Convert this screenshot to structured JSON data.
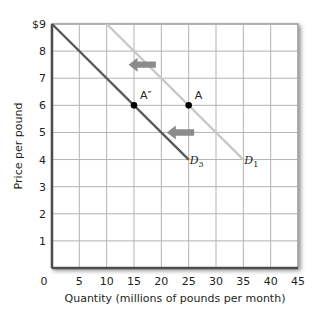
{
  "chart_data": {
    "type": "line",
    "title": "",
    "xlabel": "Quantity (millions of pounds per month)",
    "ylabel": "Price per pound",
    "xlim": [
      0,
      45
    ],
    "ylim": [
      0,
      9
    ],
    "grid": true,
    "x_ticks": [
      0,
      5,
      10,
      15,
      20,
      25,
      30,
      35,
      40,
      45
    ],
    "y_ticks": [
      1,
      2,
      3,
      4,
      5,
      6,
      7,
      8,
      9
    ],
    "y_tick_labels": [
      "1",
      "2",
      "3",
      "4",
      "5",
      "6",
      "7",
      "8",
      "$9"
    ],
    "x_tick_labels": [
      "0",
      "5",
      "10",
      "15",
      "20",
      "25",
      "30",
      "35",
      "40",
      "45"
    ],
    "series": [
      {
        "name": "D1",
        "label_main": "D",
        "label_sub": "1",
        "color": "#c8c8c8",
        "points": [
          [
            10,
            9
          ],
          [
            35,
            4
          ]
        ]
      },
      {
        "name": "D3",
        "label_main": "D",
        "label_sub": "3",
        "color": "#58595b",
        "points": [
          [
            0,
            9
          ],
          [
            25,
            4
          ]
        ]
      }
    ],
    "annotations": [
      {
        "type": "point",
        "label": "A",
        "x": 25,
        "y": 6
      },
      {
        "type": "point",
        "label": "A″",
        "x": 15,
        "y": 6
      },
      {
        "type": "arrow",
        "direction": "left",
        "x_from": 19,
        "x_to": 14,
        "y": 7.5,
        "color": "#8c8c8c"
      },
      {
        "type": "arrow",
        "direction": "left",
        "x_from": 26,
        "x_to": 21,
        "y": 5,
        "color": "#8c8c8c"
      }
    ],
    "legend": "none"
  },
  "colors": {
    "axis": "#4d4d4f",
    "grid": "#b3b3b3",
    "shadow": "#bdbdbd",
    "point": "#000000"
  }
}
